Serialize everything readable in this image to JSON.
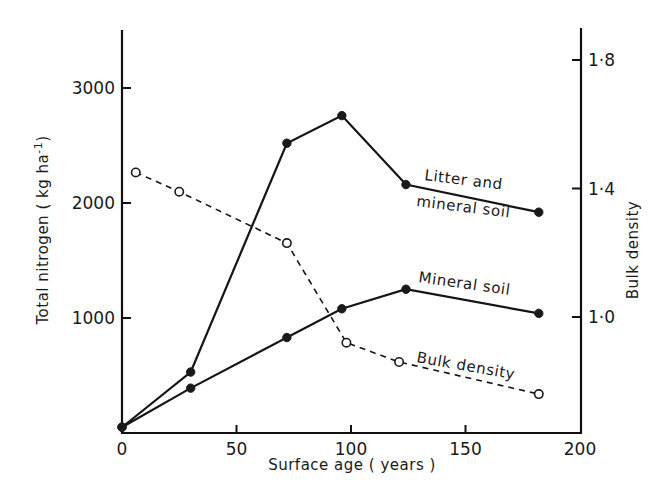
{
  "chart_data": {
    "type": "line",
    "title": "",
    "xlabel": "Surface age ( years )",
    "ylabel": "Total nitrogen ( kg ha",
    "ylabel_superscript": "-1",
    "ylabel_close": ")",
    "y2label": "Bulk density",
    "xlim": [
      0,
      200
    ],
    "ylim": [
      0,
      3500
    ],
    "y2lim": [
      0.65,
      1.9
    ],
    "x_ticks": [
      0,
      50,
      100,
      150,
      200
    ],
    "x_tick_labels": [
      "0",
      "50",
      "100",
      "150",
      "200"
    ],
    "y_ticks": [
      1000,
      2000,
      3000
    ],
    "y_tick_labels": [
      "1000",
      "2000",
      "3000"
    ],
    "y2_ticks": [
      1.0,
      1.4,
      1.8
    ],
    "y2_tick_labels": [
      "1·0",
      "1·4",
      "1·8"
    ],
    "grid": false,
    "series": [
      {
        "name": "Litter and mineral soil",
        "label_lines": [
          "Litter and",
          "mineral soil"
        ],
        "axis": "left",
        "style": "solid",
        "marker": "filled-circle",
        "x": [
          0,
          30,
          72,
          96,
          124,
          182
        ],
        "values": [
          50,
          530,
          2520,
          2760,
          2160,
          1920
        ]
      },
      {
        "name": "Mineral soil",
        "label_lines": [
          "Mineral soil"
        ],
        "axis": "left",
        "style": "solid",
        "marker": "filled-circle",
        "x": [
          0,
          30,
          72,
          96,
          124,
          182
        ],
        "values": [
          50,
          390,
          830,
          1080,
          1250,
          1040
        ]
      },
      {
        "name": "Bulk density",
        "label_lines": [
          "Bulk density"
        ],
        "axis": "right",
        "style": "dashed",
        "marker": "open-circle",
        "x": [
          6,
          25,
          72,
          98,
          121,
          182
        ],
        "values": [
          1.45,
          1.39,
          1.23,
          0.92,
          0.86,
          0.76
        ]
      }
    ]
  }
}
